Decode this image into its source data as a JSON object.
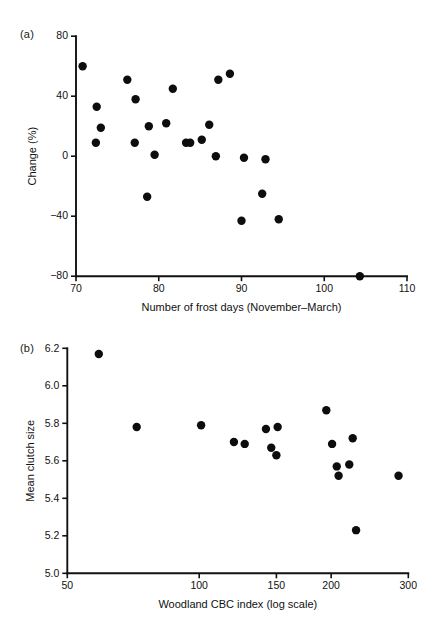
{
  "figure": {
    "background_color": "#ffffff",
    "marker_color": "#0d0d0d",
    "axis_color": "#111111"
  },
  "panels": {
    "a": {
      "label": "(a)"
    },
    "b": {
      "label": "(b)"
    }
  },
  "chart_data": [
    {
      "panel": "(a)",
      "type": "scatter",
      "title": "",
      "xlabel": "Number of frost days (November–March)",
      "ylabel": "Change (%)",
      "xlim": [
        70,
        110
      ],
      "ylim": [
        -80,
        80
      ],
      "xticks": [
        70,
        80,
        90,
        100,
        110
      ],
      "xticklabels": [
        "70",
        "80",
        "90",
        "100",
        "110"
      ],
      "yticks": [
        -80,
        -40,
        0,
        40,
        80
      ],
      "yticklabels": [
        "−80",
        "−40",
        "0",
        "40",
        "80"
      ],
      "xscale": "linear",
      "yscale": "linear",
      "grid": false,
      "legend": "none",
      "points": [
        {
          "x": 70.8,
          "y": 60
        },
        {
          "x": 72.5,
          "y": 33
        },
        {
          "x": 73.0,
          "y": 19
        },
        {
          "x": 72.4,
          "y": 9
        },
        {
          "x": 76.2,
          "y": 51
        },
        {
          "x": 77.2,
          "y": 38
        },
        {
          "x": 77.1,
          "y": 9
        },
        {
          "x": 78.8,
          "y": 20
        },
        {
          "x": 79.5,
          "y": 1
        },
        {
          "x": 78.6,
          "y": -27
        },
        {
          "x": 80.9,
          "y": 22
        },
        {
          "x": 81.7,
          "y": 45
        },
        {
          "x": 83.3,
          "y": 9
        },
        {
          "x": 83.8,
          "y": 9
        },
        {
          "x": 85.2,
          "y": 11
        },
        {
          "x": 86.1,
          "y": 21
        },
        {
          "x": 86.9,
          "y": 0
        },
        {
          "x": 87.2,
          "y": 51
        },
        {
          "x": 88.6,
          "y": 55
        },
        {
          "x": 90.3,
          "y": -1
        },
        {
          "x": 90.0,
          "y": -43
        },
        {
          "x": 92.9,
          "y": -2
        },
        {
          "x": 92.5,
          "y": -25
        },
        {
          "x": 94.5,
          "y": -42
        },
        {
          "x": 104.3,
          "y": -80
        }
      ]
    },
    {
      "panel": "(b)",
      "type": "scatter",
      "title": "",
      "xlabel": "Woodland CBC index (log scale)",
      "ylabel": "Mean clutch size",
      "xlim": [
        50,
        300
      ],
      "ylim": [
        5.0,
        6.2
      ],
      "xticks": [
        50,
        100,
        150,
        200,
        300
      ],
      "xticklabels": [
        "50",
        "100",
        "150",
        "200",
        "300"
      ],
      "yticks": [
        5.0,
        5.2,
        5.4,
        5.6,
        5.8,
        6.0,
        6.2
      ],
      "yticklabels": [
        "5.0",
        "5.2",
        "5.4",
        "5.6",
        "5.8",
        "6.0",
        "6.2"
      ],
      "xscale": "log",
      "yscale": "linear",
      "grid": false,
      "legend": "none",
      "points": [
        {
          "x": 59,
          "y": 6.17
        },
        {
          "x": 72,
          "y": 5.78
        },
        {
          "x": 101,
          "y": 5.79
        },
        {
          "x": 120,
          "y": 5.7
        },
        {
          "x": 127,
          "y": 5.69
        },
        {
          "x": 142,
          "y": 5.77
        },
        {
          "x": 151,
          "y": 5.78
        },
        {
          "x": 146,
          "y": 5.67
        },
        {
          "x": 150,
          "y": 5.63
        },
        {
          "x": 195,
          "y": 5.87
        },
        {
          "x": 201,
          "y": 5.69
        },
        {
          "x": 206,
          "y": 5.57
        },
        {
          "x": 208,
          "y": 5.52
        },
        {
          "x": 220,
          "y": 5.58
        },
        {
          "x": 224,
          "y": 5.72
        },
        {
          "x": 228,
          "y": 5.23
        },
        {
          "x": 285,
          "y": 5.52
        }
      ]
    }
  ]
}
